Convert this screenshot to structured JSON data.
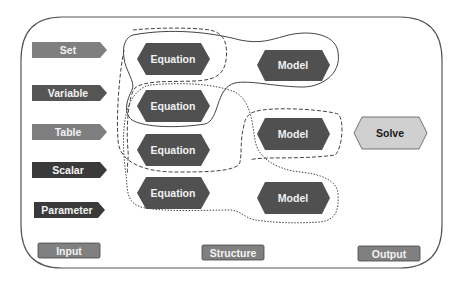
{
  "inputs": [
    {
      "label": "Set",
      "color": "#7f7f7f"
    },
    {
      "label": "Variable",
      "color": "#555555"
    },
    {
      "label": "Table",
      "color": "#7f7f7f"
    },
    {
      "label": "Scalar",
      "color": "#3a3a3a"
    },
    {
      "label": "Parameter",
      "color": "#3a3a3a"
    }
  ],
  "equations": [
    {
      "label": "Equation"
    },
    {
      "label": "Equation"
    },
    {
      "label": "Equation"
    },
    {
      "label": "Equation"
    }
  ],
  "models": [
    {
      "label": "Model"
    },
    {
      "label": "Model"
    },
    {
      "label": "Model"
    }
  ],
  "solve": {
    "label": "Solve",
    "color": "#d0d0d0"
  },
  "footer": {
    "input_label": "Input",
    "structure_label": "Structure",
    "output_label": "Output"
  },
  "colors": {
    "hexagon": "#505050",
    "outline": "#555555",
    "footer_box": "#808080"
  }
}
